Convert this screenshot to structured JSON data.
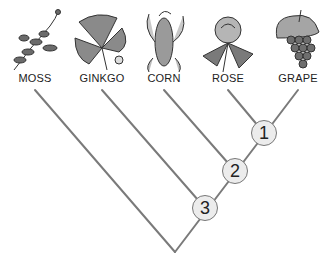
{
  "diagram": {
    "type": "cladogram",
    "taxa": [
      {
        "name": "MOSS",
        "icon": "moss-icon",
        "x": 35
      },
      {
        "name": "GINKGO",
        "icon": "ginkgo-leaf-icon",
        "x": 102
      },
      {
        "name": "CORN",
        "icon": "corn-ear-icon",
        "x": 164
      },
      {
        "name": "ROSE",
        "icon": "rose-flower-icon",
        "x": 228
      },
      {
        "name": "GRAPE",
        "icon": "grape-bunch-icon",
        "x": 298
      }
    ],
    "nodes": [
      {
        "label": "1",
        "x": 264,
        "y": 133,
        "joins": [
          "ROSE",
          "GRAPE"
        ]
      },
      {
        "label": "2",
        "x": 235,
        "y": 171,
        "joins": [
          "CORN",
          "node 1"
        ]
      },
      {
        "label": "3",
        "x": 205,
        "y": 208,
        "joins": [
          "GINKGO",
          "node 2"
        ]
      }
    ],
    "root": {
      "x": 175,
      "y": 252,
      "joins": [
        "MOSS",
        "node 3"
      ]
    },
    "colors": {
      "line": "#7a7a7a",
      "node_fill": "#ececec",
      "node_border": "#777777",
      "text": "#222222"
    }
  }
}
